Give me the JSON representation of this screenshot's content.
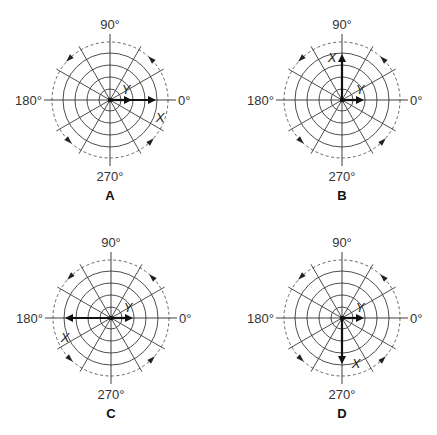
{
  "figure": {
    "angle_labels": {
      "deg0": "0°",
      "deg90": "90°",
      "deg180": "180°",
      "deg270": "270°"
    },
    "ring_radii": [
      11,
      23,
      35,
      47
    ],
    "dashed_radius": 58,
    "spoke_step_deg": 30,
    "rotation_direction": "counterclockwise",
    "panels": [
      {
        "id": "A",
        "label": "A",
        "cx": 110,
        "cy": 100,
        "vectors": [
          {
            "name": "X",
            "label": "X",
            "angle_deg": 0,
            "length": 46,
            "label_dx": 50,
            "label_dy": 18
          },
          {
            "name": "Y",
            "label": "Y",
            "angle_deg": 0,
            "length": 22,
            "label_dx": 16,
            "label_dy": -10
          }
        ]
      },
      {
        "id": "B",
        "label": "B",
        "cx": 342,
        "cy": 100,
        "vectors": [
          {
            "name": "X",
            "label": "X",
            "angle_deg": 90,
            "length": 46,
            "label_dx": -10,
            "label_dy": -42
          },
          {
            "name": "Y",
            "label": "Y",
            "angle_deg": 0,
            "length": 22,
            "label_dx": 18,
            "label_dy": -10
          }
        ]
      },
      {
        "id": "C",
        "label": "C",
        "cx": 111,
        "cy": 318,
        "vectors": [
          {
            "name": "X",
            "label": "X",
            "angle_deg": 180,
            "length": 46,
            "label_dx": -46,
            "label_dy": 20
          },
          {
            "name": "Y",
            "label": "Y",
            "angle_deg": 0,
            "length": 22,
            "label_dx": 17,
            "label_dy": -10
          }
        ]
      },
      {
        "id": "D",
        "label": "D",
        "cx": 342,
        "cy": 318,
        "vectors": [
          {
            "name": "X",
            "label": "X",
            "angle_deg": 270,
            "length": 46,
            "label_dx": 14,
            "label_dy": 46
          },
          {
            "name": "Y",
            "label": "Y",
            "angle_deg": 0,
            "length": 22,
            "label_dx": 18,
            "label_dy": -10
          }
        ]
      }
    ]
  },
  "colors": {
    "ink": "#111111",
    "grid": "#3a3a3a",
    "background": "#ffffff"
  }
}
